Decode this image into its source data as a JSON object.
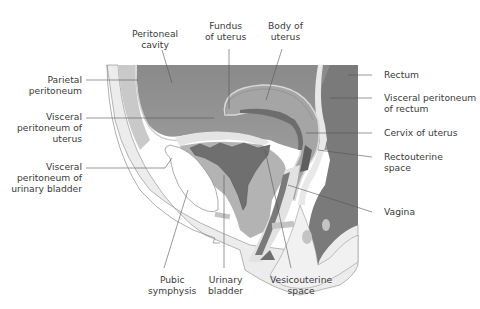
{
  "figure": {
    "colors": {
      "background": "#ffffff",
      "peritoneal_cavity": "#8e8e8e",
      "dark_organ": "#6f6f6f",
      "mid_tissue": "#b4b4b4",
      "light_tissue": "#d4d4d4",
      "pale_tissue": "#ececec",
      "bone": "#ffffff",
      "line": "#555555",
      "text": "#3a3a3a"
    },
    "labels": {
      "peritoneal_cavity": "Peritoneal\ncavity",
      "fundus_of_uterus": "Fundus\nof uterus",
      "body_of_uterus": "Body of\nuterus",
      "parietal_peritoneum": "Parietal\nperitoneum",
      "visceral_peritoneum_of_uterus": "Visceral\nperitoneum of\nuterus",
      "visceral_peritoneum_of_urinary_bladder": "Visceral\nperitoneum of\nurinary bladder",
      "rectum": "Rectum",
      "visceral_peritoneum_of_rectum": "Visceral peritoneum\nof rectum",
      "cervix_of_uterus": "Cervix of uterus",
      "rectouterine_space": "Rectouterine\nspace",
      "vagina": "Vagina",
      "pubic_symphysis": "Pubic\nsymphysis",
      "urinary_bladder": "Urinary\nbladder",
      "vesicouterine_space": "Vesicouterine\nspace"
    }
  }
}
